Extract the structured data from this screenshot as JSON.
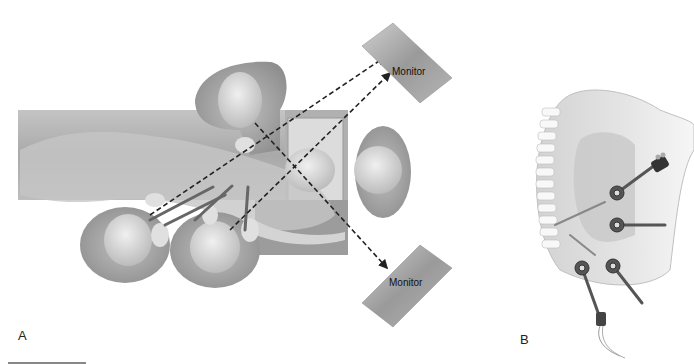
{
  "figure": {
    "panels": [
      {
        "id": "A",
        "label": "A",
        "description": "Overhead view of operating room setup for thoracoscopic spine surgery",
        "elements": {
          "monitors": [
            {
              "label": "Monitor",
              "position": "top-right"
            },
            {
              "label": "Monitor",
              "position": "bottom-right"
            }
          ],
          "surgeons": 3,
          "assistant_at_head": 1,
          "sight_lines": "dashed arrows from surgeons to monitors"
        }
      },
      {
        "id": "B",
        "label": "B",
        "description": "Lateral view of thorax with thoracoscopic ports and instruments inserted near spine",
        "elements": {
          "ports": 4,
          "instruments": [
            "endoscope camera",
            "retractor",
            "working instruments",
            "suction/irrigation"
          ]
        }
      }
    ]
  },
  "colors": {
    "background": "#ffffff",
    "table": "#b8b8b8",
    "skin": "#c8c8c8",
    "monitor": "#a8a8a8",
    "dash": "#222222"
  }
}
